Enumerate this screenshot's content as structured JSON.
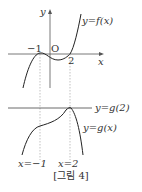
{
  "figure": {
    "caption": "[그림 4]",
    "top_graph": {
      "curve_label": "y=f(x)",
      "axis_x_label": "x",
      "axis_y_label": "y",
      "origin_label": "O",
      "tick_neg1": "−1",
      "tick_2": "2"
    },
    "bottom_graph": {
      "line_label": "y=g(2)",
      "curve_label": "y=g(x)",
      "x_label_neg1": "x=−1",
      "x_label_2": "x=2"
    },
    "colors": {
      "stroke": "#222222",
      "dashed": "#888888",
      "text": "#333333"
    }
  }
}
